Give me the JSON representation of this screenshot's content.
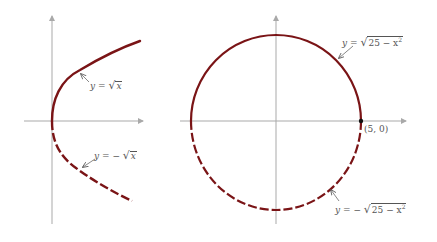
{
  "figure": {
    "left_panel": {
      "title": "Parabola x = y^2 split into two functions",
      "upper_curve": {
        "label_lhs": "y",
        "label_eq": "=",
        "label_sign": "",
        "label_radicand": "x",
        "style": "solid"
      },
      "lower_curve": {
        "label_lhs": "y",
        "label_eq": "=",
        "label_sign": "−",
        "label_radicand": "x",
        "style": "dashed"
      }
    },
    "right_panel": {
      "title": "Circle x^2 + y^2 = 25 split into two functions",
      "upper_curve": {
        "label_lhs": "y",
        "label_eq": "=",
        "label_sign": "",
        "label_radicand": "25 − x",
        "label_exp": "2",
        "style": "solid"
      },
      "lower_curve": {
        "label_lhs": "y",
        "label_eq": "=",
        "label_sign": "−",
        "label_radicand": "25 − x",
        "label_exp": "2",
        "style": "dashed"
      },
      "point": {
        "label": "(5, 0)",
        "x": 5,
        "y": 0
      }
    },
    "colors": {
      "curve": "#7a1416",
      "axis": "#a9a9a9",
      "text": "#555555",
      "point": "#111111"
    }
  }
}
